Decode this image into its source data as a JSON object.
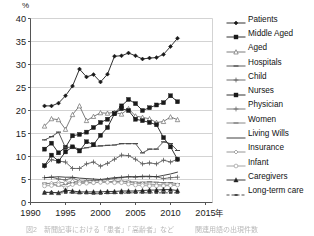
{
  "figure": {
    "unit": "%",
    "x_axis_unit_suffix": "年",
    "caption": "図2　新聞記事における「患者」「高齢者」など　　　関連用語の出現件数"
  },
  "chart_data": {
    "type": "line",
    "title": "",
    "xlabel": "",
    "ylabel": "%",
    "xlim": [
      1990,
      2016
    ],
    "ylim": [
      0,
      40
    ],
    "xticks": [
      1990,
      1995,
      2000,
      2005,
      2010,
      2015
    ],
    "yticks": [
      0,
      5,
      10,
      15,
      20,
      25,
      30,
      35,
      40
    ],
    "grid": "horizontal",
    "legend_position": "right",
    "x": [
      1992,
      1993,
      1994,
      1995,
      1996,
      1997,
      1998,
      1999,
      2000,
      2001,
      2002,
      2003,
      2004,
      2005,
      2006,
      2007,
      2008,
      2009,
      2010,
      2011
    ],
    "series": [
      {
        "name": "Patients",
        "marker": "filled-diamond",
        "line": "solid",
        "color": "#1a1a1a",
        "values": [
          21.0,
          21.0,
          21.6,
          23.2,
          25.3,
          29.0,
          27.3,
          27.8,
          26.2,
          27.9,
          31.8,
          31.9,
          32.5,
          31.9,
          31.2,
          31.4,
          31.5,
          32.2,
          33.9,
          35.7
        ]
      },
      {
        "name": "Middle Aged",
        "marker": "filled-square",
        "line": "solid",
        "color": "#1a1a1a",
        "values": [
          11.6,
          12.9,
          10.8,
          12.0,
          14.5,
          14.8,
          15.3,
          16.3,
          17.4,
          18.1,
          19.4,
          21.0,
          22.4,
          21.5,
          20.0,
          20.6,
          21.2,
          21.7,
          23.2,
          21.9
        ]
      },
      {
        "name": "Aged",
        "marker": "open-triangle",
        "line": "solid",
        "color": "#6d6d6d",
        "values": [
          16.6,
          18.2,
          18.0,
          15.9,
          19.1,
          21.0,
          17.8,
          18.7,
          19.5,
          19.4,
          19.6,
          19.2,
          20.4,
          18.8,
          18.5,
          18.2,
          17.4,
          17.6,
          18.6,
          18.0
        ]
      },
      {
        "name": "Hospitals",
        "marker": "dash",
        "line": "solid",
        "color": "#4a4a4a",
        "values": [
          13.6,
          14.3,
          15.3,
          11.9,
          12.1,
          11.6,
          11.9,
          12.2,
          12.3,
          12.4,
          12.5,
          12.8,
          12.8,
          12.8,
          10.8,
          11.6,
          11.6,
          13.2,
          12.8,
          11.3
        ]
      },
      {
        "name": "Child",
        "marker": "plus",
        "line": "solid",
        "color": "#5c5c5c",
        "values": [
          7.9,
          9.3,
          9.0,
          8.8,
          7.4,
          7.4,
          8.4,
          8.8,
          7.9,
          8.5,
          9.4,
          10.3,
          10.2,
          9.4,
          8.4,
          8.6,
          8.4,
          9.2,
          8.8,
          9.4
        ]
      },
      {
        "name": "Nurses",
        "marker": "filled-square",
        "line": "solid",
        "color": "#1a1a1a",
        "values": [
          8.0,
          10.3,
          9.0,
          11.0,
          12.1,
          11.2,
          13.2,
          12.6,
          14.6,
          16.3,
          19.3,
          20.4,
          20.0,
          18.1,
          17.8,
          17.4,
          16.9,
          14.1,
          12.1,
          9.4
        ]
      },
      {
        "name": "Physician",
        "marker": "plus",
        "line": "solid",
        "color": "#6a6a6a",
        "values": [
          5.4,
          5.5,
          5.1,
          4.9,
          5.4,
          4.6,
          4.7,
          4.8,
          4.8,
          5.0,
          5.2,
          5.4,
          5.6,
          5.5,
          5.6,
          5.6,
          5.6,
          5.2,
          5.4,
          5.5
        ]
      },
      {
        "name": "Women",
        "marker": "dash",
        "line": "solid",
        "color": "#7a7a7a",
        "values": [
          4.2,
          4.1,
          3.6,
          4.0,
          4.3,
          4.2,
          4.3,
          4.4,
          4.4,
          4.5,
          4.6,
          4.6,
          4.6,
          4.4,
          4.4,
          4.5,
          4.4,
          4.3,
          4.3,
          4.1
        ]
      },
      {
        "name": "Living Wills",
        "marker": "none",
        "line": "solid",
        "color": "#2b2b2b",
        "values": [
          5.4,
          5.5,
          5.6,
          5.5,
          5.5,
          5.3,
          5.2,
          5.1,
          5.0,
          5.2,
          5.4,
          5.5,
          5.6,
          5.6,
          5.7,
          5.7,
          5.6,
          5.9,
          6.2,
          6.6
        ]
      },
      {
        "name": "Insurance",
        "marker": "open-diamond",
        "line": "solid",
        "color": "#8a8a8a",
        "values": [
          4.0,
          4.2,
          4.4,
          4.3,
          4.6,
          4.5,
          4.4,
          4.3,
          4.4,
          4.5,
          4.5,
          4.6,
          4.4,
          4.2,
          4.1,
          4.0,
          3.9,
          3.8,
          3.8,
          3.8
        ]
      },
      {
        "name": "Infant",
        "marker": "open-circle",
        "line": "solid",
        "color": "#9a9a9a",
        "values": [
          3.6,
          3.7,
          3.9,
          3.2,
          3.9,
          4.1,
          4.2,
          4.3,
          4.4,
          4.4,
          4.3,
          4.3,
          4.0,
          3.8,
          3.7,
          3.6,
          3.6,
          3.6,
          3.7,
          3.8
        ]
      },
      {
        "name": "Caregivers",
        "marker": "filled-triangle",
        "line": "solid",
        "color": "#222222",
        "values": [
          2.2,
          2.2,
          2.1,
          2.7,
          2.5,
          2.3,
          2.3,
          2.3,
          2.3,
          2.4,
          2.4,
          2.5,
          2.5,
          2.5,
          2.6,
          2.7,
          2.7,
          2.8,
          2.8,
          2.6
        ]
      },
      {
        "name": "Long-term care",
        "marker": "small-dash",
        "line": "dashed",
        "color": "#3a3a3a",
        "values": [
          2.2,
          2.2,
          2.1,
          2.1,
          2.1,
          2.0,
          2.0,
          1.9,
          1.9,
          2.0,
          2.0,
          2.0,
          2.1,
          2.1,
          2.1,
          2.1,
          2.1,
          2.1,
          2.1,
          2.1
        ]
      }
    ]
  },
  "legend": {
    "items": [
      {
        "label": "Patients"
      },
      {
        "label": "Middle Aged"
      },
      {
        "label": "Aged"
      },
      {
        "label": "Hospitals"
      },
      {
        "label": "Child"
      },
      {
        "label": "Nurses"
      },
      {
        "label": "Physician"
      },
      {
        "label": "Women"
      },
      {
        "label": "Living Wills"
      },
      {
        "label": "Insurance"
      },
      {
        "label": "Infant"
      },
      {
        "label": "Caregivers"
      },
      {
        "label": "Long-term care"
      }
    ]
  }
}
